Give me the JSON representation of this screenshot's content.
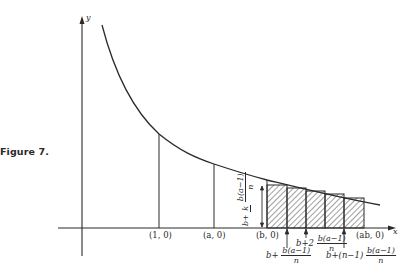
{
  "caption": "Figure 7.",
  "axes": {
    "y_label": "y",
    "x_label": "x"
  },
  "points": {
    "p1": "(1, 0)",
    "pa": "(a, 0)",
    "pb": "(b, 0)",
    "pab": "(ab, 0)"
  },
  "annotations": {
    "first": {
      "prefix": "b+",
      "num": "b(a−1)",
      "den": "n"
    },
    "second": {
      "prefix": "b+2",
      "num": "b(a−1)",
      "den": "n"
    },
    "last": {
      "prefix": "b+(n−1)",
      "num": "b(a−1)",
      "den": "n"
    },
    "vertical": {
      "prefix": "b+",
      "coef": "k",
      "num": "b(a−1)",
      "den": "n"
    }
  },
  "colors": {
    "ink": "#2a2a2a",
    "paper": "#ffffff"
  },
  "geometry": {
    "curve": "y = 1/x",
    "rectangles": 5,
    "shaded": true
  }
}
